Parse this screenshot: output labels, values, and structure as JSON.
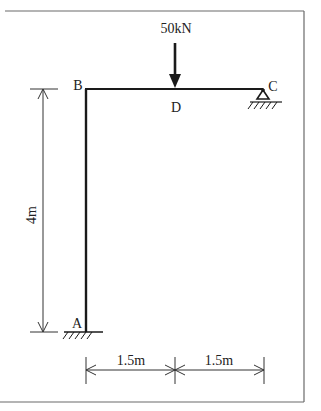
{
  "diagram": {
    "type": "structural-frame",
    "nodes": {
      "A": {
        "label": "A",
        "support": "fixed"
      },
      "B": {
        "label": "B",
        "support": "none"
      },
      "C": {
        "label": "C",
        "support": "pinned"
      },
      "D": {
        "label": "D",
        "support": "none"
      }
    },
    "members": [
      {
        "from": "A",
        "to": "B",
        "orientation": "vertical"
      },
      {
        "from": "B",
        "to": "C",
        "orientation": "horizontal"
      }
    ],
    "loads": [
      {
        "at": "D",
        "label": "50kN",
        "value": 50,
        "unit": "kN",
        "direction": "down"
      }
    ],
    "dimensions": {
      "height": {
        "label": "4m",
        "value": 4,
        "unit": "m",
        "between": [
          "A",
          "B"
        ]
      },
      "spans": [
        {
          "label": "1.5m",
          "value": 1.5,
          "unit": "m",
          "between": [
            "B",
            "D"
          ]
        },
        {
          "label": "1.5m",
          "value": 1.5,
          "unit": "m",
          "between": [
            "D",
            "C"
          ]
        }
      ]
    },
    "colors": {
      "line": "#1a1a1a",
      "frame": "#6a6a6a",
      "text": "#222222"
    }
  }
}
